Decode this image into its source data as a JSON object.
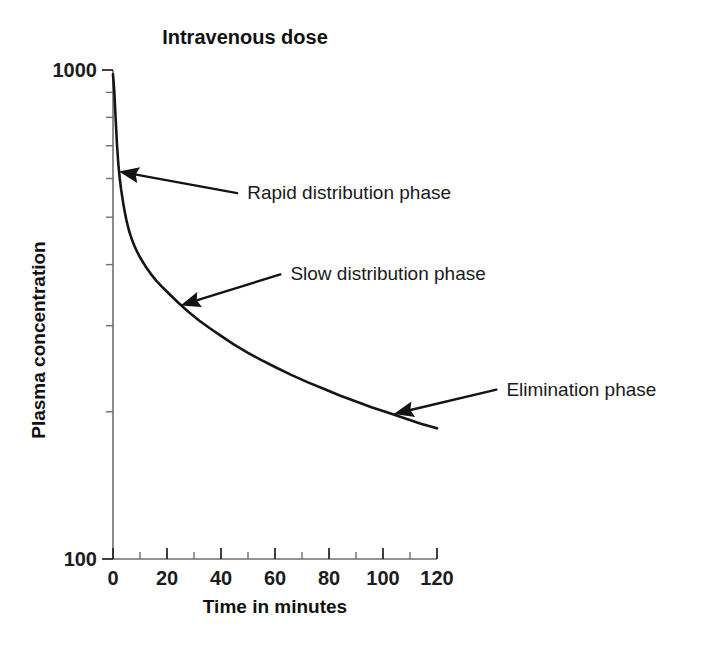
{
  "chart_data": {
    "type": "line",
    "title": "Intravenous dose",
    "xlabel": "Time in minutes",
    "ylabel": "Plasma concentration",
    "yscale": "log",
    "xscale": "linear",
    "xlim": [
      0,
      120
    ],
    "ylim": [
      100,
      1000
    ],
    "grid": false,
    "legend": null,
    "xticks": [
      0,
      20,
      40,
      60,
      80,
      100,
      120
    ],
    "xtick_labels": [
      "0",
      "20",
      "40",
      "60",
      "80",
      "100",
      "120"
    ],
    "xminor_ticks": [
      10,
      30,
      50,
      70,
      90,
      110
    ],
    "yticks": [
      100,
      1000
    ],
    "ytick_labels": [
      "100",
      "1000"
    ],
    "yminor_ticks": [
      200,
      300,
      400,
      500,
      600,
      700,
      800,
      900
    ],
    "series": [
      {
        "name": "Plasma concentration",
        "x": [
          0,
          0.5,
          1,
          1.5,
          2,
          2.5,
          3,
          4,
          5,
          6,
          7,
          8,
          9,
          10,
          12,
          14,
          16,
          18,
          20,
          24,
          28,
          32,
          36,
          40,
          45,
          50,
          55,
          60,
          66,
          72,
          78,
          84,
          90,
          96,
          102,
          108,
          114,
          120
        ],
        "y": [
          980,
          900,
          790,
          700,
          640,
          600,
          570,
          525,
          492,
          468,
          450,
          436,
          424,
          414,
          397,
          383,
          371,
          361,
          352,
          335,
          320,
          307,
          296,
          286,
          274,
          264,
          255,
          247,
          238,
          230,
          223,
          216,
          210,
          204,
          199,
          194,
          189,
          185
        ]
      }
    ],
    "annotations": [
      {
        "id": "rapid-distribution-phase",
        "text": "Rapid distribution phase",
        "target_x": 2.2,
        "target_y": 620,
        "label_x": 46,
        "label_y": 560
      },
      {
        "id": "slow-distribution-phase",
        "text": "Slow distribution phase",
        "target_x": 25,
        "target_y": 330,
        "label_x": 62,
        "label_y": 382
      },
      {
        "id": "elimination-phase",
        "text": "Elimination phase",
        "target_x": 104,
        "target_y": 198,
        "label_x": 142,
        "label_y": 222
      }
    ]
  }
}
